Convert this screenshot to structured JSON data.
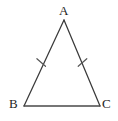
{
  "figure": {
    "kind": "geometry-diagram",
    "shape": "isosceles-triangle",
    "background_color": "#ffffff",
    "stroke_color": "#3a3a3a",
    "label_color": "#1d1d1d",
    "stroke_width": 1.2,
    "canvas": {
      "width": 118,
      "height": 121
    },
    "vertices": [
      {
        "name": "A",
        "label": "A",
        "x": 64,
        "y": 20,
        "label_x": 59,
        "label_y": 4
      },
      {
        "name": "B",
        "label": "B",
        "x": 24,
        "y": 106,
        "label_x": 9,
        "label_y": 97
      },
      {
        "name": "C",
        "label": "C",
        "x": 100,
        "y": 106,
        "label_x": 102,
        "label_y": 97
      }
    ],
    "sides": [
      {
        "name": "AB",
        "from": "A",
        "to": "B",
        "tick_marks": 1
      },
      {
        "name": "AC",
        "from": "A",
        "to": "C",
        "tick_marks": 1
      },
      {
        "name": "BC",
        "from": "B",
        "to": "C",
        "tick_marks": 0
      }
    ],
    "congruence_marks": [
      {
        "name": "tick-mark-ab",
        "side": "AB",
        "cx": 41.2,
        "cy": 62.5,
        "length": 9,
        "angle_deg": 25
      },
      {
        "name": "tick-mark-ac",
        "side": "AC",
        "cx": 82.5,
        "cy": 62.5,
        "length": 9,
        "angle_deg": -25
      }
    ]
  }
}
